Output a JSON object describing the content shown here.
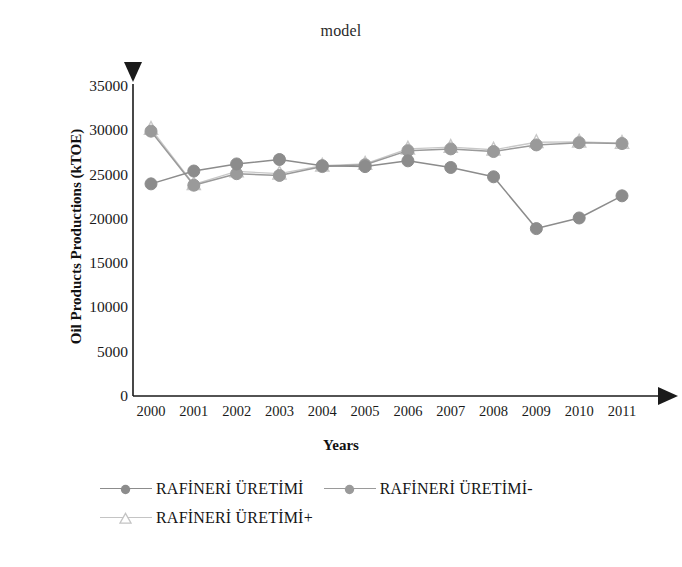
{
  "chart_data": {
    "type": "line",
    "title": "model",
    "xlabel": "Years",
    "ylabel": "Oil Products Productions (kTOE)",
    "categories": [
      "2000",
      "2001",
      "2002",
      "2003",
      "2004",
      "2005",
      "2006",
      "2007",
      "2008",
      "2009",
      "2010",
      "2011"
    ],
    "x": [
      2000,
      2001,
      2002,
      2003,
      2004,
      2005,
      2006,
      2007,
      2008,
      2009,
      2010,
      2011
    ],
    "ylim": [
      0,
      35000
    ],
    "yticks": [
      0,
      5000,
      10000,
      15000,
      20000,
      25000,
      30000,
      35000
    ],
    "ytick_labels": [
      "0",
      "5000",
      "10000",
      "15000",
      "20000",
      "25000",
      "30000",
      "35000"
    ],
    "grid": false,
    "legend_position": "bottom",
    "series": [
      {
        "name": "RAFİNERİ ÜRETİMİ",
        "marker": "circle",
        "color": "#8c8c8c",
        "values": [
          23950,
          25400,
          26200,
          26700,
          26000,
          25900,
          26550,
          25800,
          24750,
          18900,
          20100,
          22600
        ]
      },
      {
        "name": "RAFİNERİ ÜRETİMİ-",
        "marker": "circle",
        "color": "#9a9a9a",
        "values": [
          29900,
          23800,
          25100,
          24900,
          25900,
          26100,
          27700,
          27900,
          27600,
          28350,
          28600,
          28500
        ]
      },
      {
        "name": "RAFİNERİ ÜRETİMİ+",
        "marker": "triangle",
        "color": "#c8c8c8",
        "values": [
          30150,
          23900,
          25350,
          25100,
          26000,
          26200,
          27900,
          28100,
          27800,
          28650,
          28700,
          28550
        ]
      }
    ]
  },
  "axes": {
    "y_arrow": "up-arrow",
    "x_arrow": "right-arrow",
    "axis_color": "#1a1a1a"
  },
  "legend": {
    "rows": [
      [
        {
          "label": "RAFİNERİ ÜRETİMİ",
          "marker": "circle",
          "color": "#8c8c8c"
        },
        {
          "label": "RAFİNERİ ÜRETİMİ-",
          "marker": "circle",
          "color": "#9a9a9a"
        }
      ],
      [
        {
          "label": "RAFİNERİ ÜRETİMİ+",
          "marker": "triangle",
          "color": "#c4c4c4"
        }
      ]
    ]
  }
}
